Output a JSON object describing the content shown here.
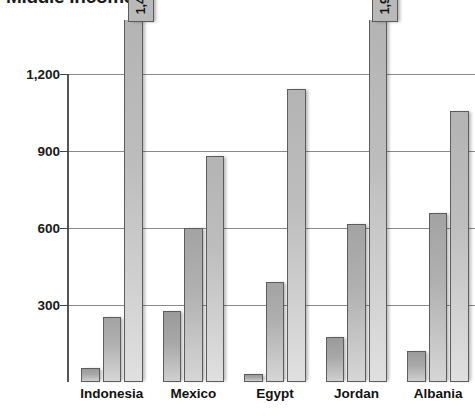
{
  "chart_data": {
    "type": "bar",
    "title": "Middle Income",
    "xlabel": "",
    "ylabel": "",
    "categories": [
      "Indonesia",
      "Mexico",
      "Egypt",
      "Jordan",
      "Albania"
    ],
    "series": [
      {
        "name": "series-1",
        "values": [
          55,
          275,
          30,
          175,
          120
        ]
      },
      {
        "name": "series-2",
        "values": [
          255,
          600,
          390,
          615,
          660
        ]
      },
      {
        "name": "series-3",
        "values": [
          1490,
          880,
          1140,
          1960,
          1055
        ]
      }
    ],
    "ylim": [
      0,
      1200
    ],
    "yticks": [
      300,
      600,
      900,
      1200
    ],
    "ytick_labels": [
      "300",
      "600",
      "900",
      "1,200"
    ],
    "grid": true,
    "legend": "none",
    "annotations": [
      {
        "label": "1,490",
        "category": "Indonesia",
        "series": "series-3",
        "value": 1490,
        "style": "clipped-arrow-callout"
      },
      {
        "label": "1,960",
        "category": "Jordan",
        "series": "series-3",
        "value": 1960,
        "style": "clipped-arrow-callout"
      }
    ],
    "colors": {
      "series_1": "#a8a8a8",
      "series_2": "#b0b0b0",
      "series_3": "#bdbdbd",
      "grid": "#8a8a8a",
      "axis": "#555555",
      "text": "#1a1a1a",
      "callout": "#b9b9b9"
    }
  }
}
